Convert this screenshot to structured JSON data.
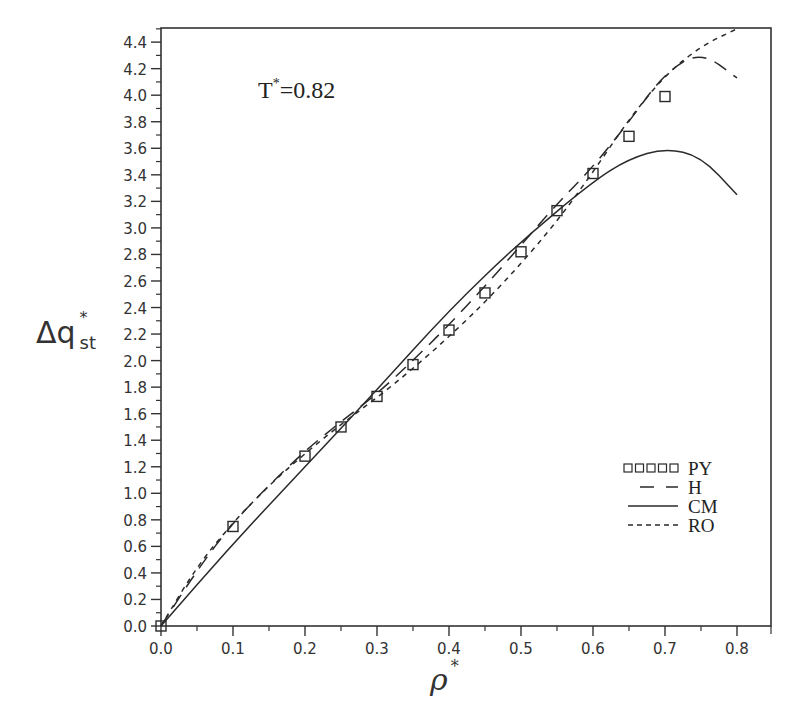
{
  "chart_data": {
    "type": "line",
    "title": "",
    "annotation": "T*=0.82",
    "annotation_parts": {
      "base": "T",
      "sup": "*",
      "rest": "=0.82"
    },
    "xlabel": "ρ*",
    "xlabel_parts": {
      "base": "ρ",
      "sup": "*"
    },
    "ylabel": "Δq*st",
    "ylabel_parts": {
      "base": "Δq",
      "sup": "*",
      "sub": "st"
    },
    "xlim": [
      0.0,
      0.85
    ],
    "ylim": [
      0.0,
      4.5
    ],
    "x_ticks": [
      "0.0",
      "0.1",
      "0.2",
      "0.3",
      "0.4",
      "0.5",
      "0.6",
      "0.7",
      "0.8"
    ],
    "y_ticks": [
      "0.0",
      "0.2",
      "0.4",
      "0.6",
      "0.8",
      "1.0",
      "1.2",
      "1.4",
      "1.6",
      "1.8",
      "2.0",
      "2.2",
      "2.4",
      "2.6",
      "2.8",
      "3.0",
      "3.2",
      "3.4",
      "3.6",
      "3.8",
      "4.0",
      "4.2",
      "4.4"
    ],
    "grid": false,
    "legend_position": "lower right",
    "legend": [
      {
        "name": "PY",
        "style": "squares"
      },
      {
        "name": "H",
        "style": "long-dash"
      },
      {
        "name": "CM",
        "style": "solid"
      },
      {
        "name": "RO",
        "style": "short-dash"
      }
    ],
    "series": [
      {
        "name": "PY",
        "style": "squares",
        "x": [
          0.0,
          0.1,
          0.2,
          0.25,
          0.3,
          0.35,
          0.4,
          0.45,
          0.5,
          0.55,
          0.6,
          0.65,
          0.7
        ],
        "y": [
          0.0,
          0.75,
          1.28,
          1.5,
          1.73,
          1.97,
          2.23,
          2.51,
          2.82,
          3.13,
          3.41,
          3.69,
          3.99
        ]
      },
      {
        "name": "H",
        "style": "long-dash",
        "x": [
          0.0,
          0.05,
          0.1,
          0.15,
          0.2,
          0.25,
          0.3,
          0.35,
          0.4,
          0.45,
          0.5,
          0.55,
          0.6,
          0.65,
          0.7,
          0.75,
          0.8
        ],
        "y": [
          0.0,
          0.42,
          0.78,
          1.06,
          1.32,
          1.54,
          1.75,
          2.0,
          2.27,
          2.56,
          2.87,
          3.18,
          3.46,
          3.8,
          4.17,
          4.33,
          4.13
        ]
      },
      {
        "name": "CM",
        "style": "solid",
        "x": [
          0.0,
          0.1,
          0.2,
          0.3,
          0.4,
          0.5,
          0.6,
          0.65,
          0.7,
          0.75,
          0.8
        ],
        "y": [
          0.0,
          0.62,
          1.2,
          1.78,
          2.38,
          2.9,
          3.35,
          3.52,
          3.6,
          3.54,
          3.25
        ]
      },
      {
        "name": "RO",
        "style": "short-dash",
        "x": [
          0.0,
          0.05,
          0.1,
          0.15,
          0.2,
          0.25,
          0.3,
          0.35,
          0.4,
          0.45,
          0.5,
          0.55,
          0.6,
          0.65,
          0.7,
          0.75,
          0.8
        ],
        "y": [
          0.0,
          0.45,
          0.78,
          1.06,
          1.3,
          1.52,
          1.72,
          1.94,
          2.18,
          2.44,
          2.73,
          3.05,
          3.42,
          3.82,
          4.15,
          4.37,
          4.5
        ]
      }
    ]
  },
  "colors": {
    "axis": "#333333",
    "line": "#2a2a2a",
    "text": "#222222"
  }
}
